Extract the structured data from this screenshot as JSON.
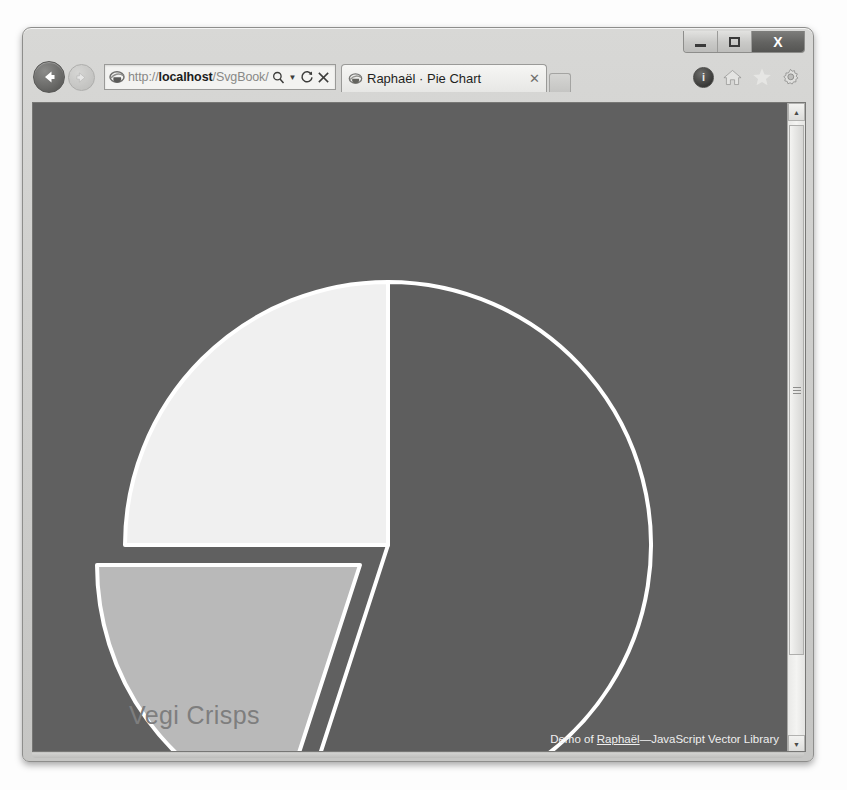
{
  "window": {
    "controls": {
      "minimize_label": "Minimize",
      "maximize_label": "Restore",
      "close_label": "X"
    }
  },
  "navigation": {
    "back_label": "Back",
    "forward_label": "Forward",
    "address": {
      "url_prefix": "http://",
      "url_host": "localhost",
      "url_path": "/SvgBook/ ",
      "search_icon": "search-icon",
      "dropdown_icon": "▼",
      "refresh_icon": "⟳",
      "stop_icon": "✕"
    }
  },
  "tabs": [
    {
      "title": "Raphaël · Pie Chart",
      "close_icon": "✕",
      "active": true
    }
  ],
  "toolbar_icons": [
    {
      "name": "compatibility-view-icon",
      "glyph": "ⓘ"
    },
    {
      "name": "home-icon",
      "glyph": "home"
    },
    {
      "name": "favorites-icon",
      "glyph": "star"
    },
    {
      "name": "tools-icon",
      "glyph": "gear"
    }
  ],
  "scrollbar": {
    "up_arrow": "▲",
    "down_arrow": "▼"
  },
  "content": {
    "background_color": "#606060",
    "watermark_label": "Vegi Crisps",
    "credit": {
      "prefix": "Demo of ",
      "link_text": "Raphaël",
      "suffix": "—JavaScript Vector Library"
    }
  },
  "chart_data": {
    "type": "pie",
    "title": "Raphaël · Pie Chart",
    "center": {
      "x": 355,
      "y": 442
    },
    "radius": 263,
    "stroke_color": "#ffffff",
    "stroke_width": 4,
    "background": "#606060",
    "labels": [
      "Vegi Crisps"
    ],
    "slices": [
      {
        "name": "slice-large-dark",
        "label": "",
        "value": 55,
        "start_angle": 0,
        "end_angle": 198,
        "color": "#5e5e5e",
        "exploded": false
      },
      {
        "name": "slice-light",
        "label": "",
        "value": 25,
        "start_angle": 270,
        "end_angle": 360,
        "color": "#f0f0f0",
        "exploded": false
      },
      {
        "name": "slice-vegi-crisps",
        "label": "Vegi Crisps",
        "value": 20,
        "start_angle": 198,
        "end_angle": 270,
        "color": "#b9b9b9",
        "exploded": true,
        "explode_offset": {
          "dx": -28,
          "dy": 20
        }
      }
    ]
  }
}
